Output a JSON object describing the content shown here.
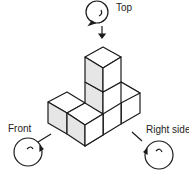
{
  "labels": {
    "top": "Top",
    "front": "Front",
    "right": "Right side"
  },
  "colors": {
    "line": "#1a1a1a",
    "shade": "#e6e6e6",
    "face": "#ffffff"
  }
}
